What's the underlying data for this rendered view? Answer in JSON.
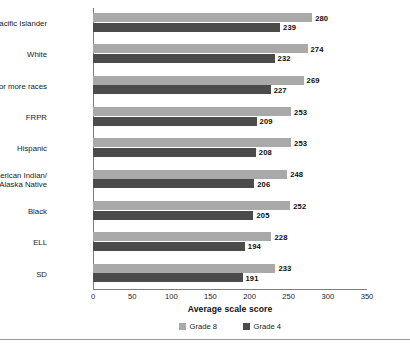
{
  "chart_data": {
    "type": "bar",
    "orientation": "horizontal",
    "title": "",
    "xlabel": "Average scale score",
    "ylabel": "",
    "xlim": [
      0,
      350
    ],
    "xticks": [
      0,
      50,
      100,
      150,
      200,
      250,
      300,
      350
    ],
    "grid": false,
    "legend_position": "bottom-center",
    "categories": [
      "Asian/Pacific Islander",
      "White",
      "Two or more races",
      "FRPR",
      "Hispanic",
      "American Indian/\nAlaska Native",
      "Black",
      "ELL",
      "SD"
    ],
    "series": [
      {
        "name": "Grade 8",
        "color": "#a9a9a9",
        "values": [
          280,
          274,
          269,
          253,
          253,
          248,
          252,
          228,
          233
        ]
      },
      {
        "name": "Grade 4",
        "color": "#4b4b4b",
        "values": [
          239,
          232,
          227,
          209,
          208,
          206,
          205,
          194,
          191
        ]
      }
    ]
  },
  "legend": {
    "items": [
      {
        "label": "Grade 8",
        "color": "#a9a9a9"
      },
      {
        "label": "Grade 4",
        "color": "#4b4b4b"
      }
    ]
  },
  "axis": {
    "x_title": "Average scale score"
  }
}
